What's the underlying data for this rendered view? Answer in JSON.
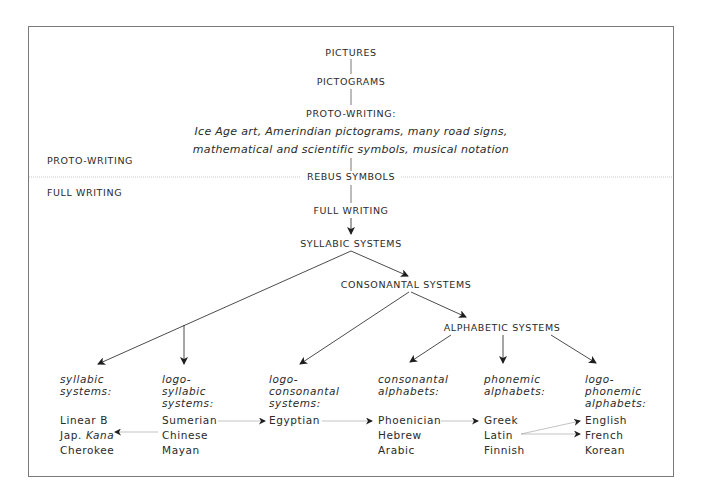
{
  "side_labels": {
    "proto_writing": "PROTO-WRITING",
    "full_writing": "FULL WRITING"
  },
  "nodes": {
    "pictures": "PICTURES",
    "pictograms": "PICTOGRAMS",
    "proto_writing": "PROTO-WRITING:",
    "proto_examples_line1": "Ice Age art, Amerindian pictograms, many road signs,",
    "proto_examples_line2": "mathematical and scientific symbols, musical notation",
    "rebus_symbols": "REBUS SYMBOLS",
    "full_writing": "FULL WRITING",
    "syllabic_systems": "SYLLABIC SYSTEMS",
    "consonantal_systems": "CONSONANTAL SYSTEMS",
    "alphabetic_systems": "ALPHABETIC SYSTEMS"
  },
  "columns": [
    {
      "header": [
        "syllabic",
        "systems:"
      ],
      "items": [
        "Linear B",
        "Jap. ",
        "Cherokee"
      ],
      "item2_italic": "Kana"
    },
    {
      "header": [
        "logo-",
        "syllabic",
        "systems:"
      ],
      "items": [
        "Sumerian",
        "Chinese",
        "Mayan"
      ]
    },
    {
      "header": [
        "logo-",
        "consonantal",
        "systems:"
      ],
      "items": [
        "Egyptian"
      ]
    },
    {
      "header": [
        "consonantal",
        "alphabets:"
      ],
      "items": [
        "Phoenician",
        "Hebrew",
        "Arabic"
      ]
    },
    {
      "header": [
        "phonemic",
        "alphabets:"
      ],
      "items": [
        "Greek",
        "Latin",
        "Finnish"
      ]
    },
    {
      "header": [
        "logo-",
        "phonemic",
        "alphabets:"
      ],
      "items": [
        "English",
        "French",
        "Korean"
      ]
    }
  ],
  "colors": {
    "line": "#2a2a2a",
    "thin_line": "#9a9a9a",
    "frame": "#7a7a7a",
    "divider": "#c8c8c8"
  }
}
